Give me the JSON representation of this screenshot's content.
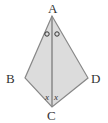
{
  "diagram": {
    "fill_color": "#dcdcdc",
    "stroke_color": "#888888",
    "vertices": {
      "A": {
        "label": "A",
        "x": 52,
        "y": 16
      },
      "B": {
        "label": "B",
        "x": 25,
        "y": 78
      },
      "C": {
        "label": "C",
        "x": 52,
        "y": 107
      },
      "D": {
        "label": "D",
        "x": 88,
        "y": 78
      }
    },
    "angle_marks": {
      "at_A": {
        "left": "o",
        "right": "o"
      },
      "at_C": {
        "left": "x",
        "right": "x"
      }
    }
  }
}
